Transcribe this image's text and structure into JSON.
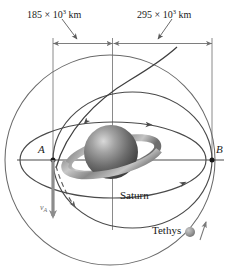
{
  "figure": {
    "background_color": "#ffffff",
    "width": 230,
    "height": 268
  },
  "dimensions": {
    "left": {
      "value": "185 × 10",
      "exponent": "3",
      "unit": " km",
      "full_text": "185 × 10³ km",
      "magnitude": 185,
      "power": 3,
      "units": "km"
    },
    "right": {
      "value": "295 × 10",
      "exponent": "3",
      "unit": " km",
      "full_text": "295 × 10³ km",
      "magnitude": 295,
      "power": 3,
      "units": "km"
    }
  },
  "points": {
    "a": {
      "label": "A"
    },
    "b": {
      "label": "B"
    }
  },
  "bodies": {
    "planet": {
      "label": "Saturn",
      "color": "#6b6b6b"
    },
    "moon": {
      "label": "Tethys",
      "color": "#9a9a9a"
    }
  },
  "vectors": {
    "velocity_a": {
      "symbol": "v",
      "subscript": "A",
      "full_text": "vA",
      "color": "#8c8c8c"
    }
  },
  "colors": {
    "line": "#4a4a4a",
    "dim_line": "#7a7a7a",
    "accent_gray": "#8c8c8c",
    "text": "#1a1a1a"
  }
}
